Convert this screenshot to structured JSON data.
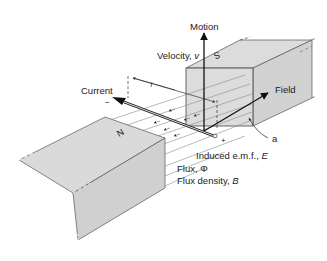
{
  "diagram": {
    "labels": {
      "motion": "Motion",
      "velocity": "Velocity, ",
      "velocity_symbol": "v",
      "current": "Current",
      "field": "Field",
      "a": "a",
      "emf": "Induced e.m.f., ",
      "emf_symbol": "E",
      "flux": "Flux, Φ",
      "flux_density": "Flux density, ",
      "flux_density_symbol": "B",
      "minus": "−",
      "plus": "+"
    },
    "poles": {
      "north": "N",
      "south": "S"
    },
    "colors": {
      "magnet_fill": "#d9d9d9",
      "magnet_shade": "#cfcfcf",
      "line": "#222222",
      "flux_line": "#8a8a8a"
    }
  }
}
